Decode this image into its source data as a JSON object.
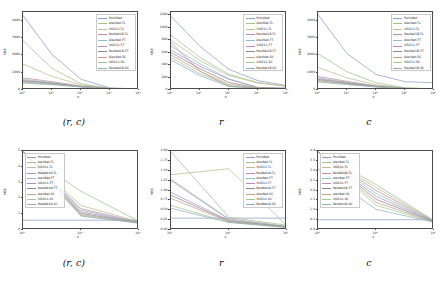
{
  "figure": {
    "title": "",
    "panel_captions": [
      "(r, c)",
      "r",
      "c",
      "(r, c)",
      "r",
      "c"
    ]
  },
  "legend_labels": [
    "PointNet",
    "AlexNet-TL",
    "VGG11-TL",
    "ResNet18-TL",
    "AlexNet-FT",
    "VGG11-FT",
    "ResNet18-FT",
    "AlexNet-SC",
    "VGG11-SC",
    "ResNet18-SC"
  ],
  "colors": {
    "PointNet": "#8c9ec4",
    "AlexNet-TL": "#9ec48c",
    "VGG11-TL": "#c4b98c",
    "ResNet18-TL": "#c48c9e",
    "AlexNet-FT": "#8cc4bd",
    "VGG11-FT": "#b08cc4",
    "ResNet18-FT": "#8a8a8a",
    "AlexNet-SC": "#c4a08c",
    "VGG11-SC": "#a7c48c",
    "ResNet18-SC": "#8cb0c4"
  },
  "panels": [
    {
      "id": "top-left",
      "caption": "(r, c)",
      "legend_position": "upper-right",
      "chart_data": {
        "type": "line",
        "title": "",
        "xlabel": "n",
        "ylabel": "MSE",
        "xscale": "log",
        "xlim": [
          1,
          10000
        ],
        "ylim": [
          0,
          4500
        ],
        "xticks": [
          "10⁰",
          "10¹",
          "10²",
          "10³",
          "10⁴"
        ],
        "xtick_values": [
          1,
          10,
          100,
          1000,
          10000
        ],
        "yticks": [
          "4000",
          "3000",
          "2000",
          "1000",
          "0"
        ],
        "ytick_values": [
          4000,
          3000,
          2000,
          1000,
          0
        ],
        "grid": false,
        "legend_position": "upper right",
        "x": [
          1,
          10,
          100,
          1000,
          10000
        ],
        "series": [
          {
            "name": "PointNet",
            "values": [
              4300,
              2050,
              620,
              120,
              60
            ]
          },
          {
            "name": "AlexNet-TL",
            "values": [
              2850,
              1250,
              360,
              95,
              55
            ]
          },
          {
            "name": "VGG11-TL",
            "values": [
              1500,
              780,
              300,
              90,
              50
            ]
          },
          {
            "name": "ResNet18-TL",
            "values": [
              700,
              480,
              230,
              85,
              50
            ]
          },
          {
            "name": "AlexNet-FT",
            "values": [
              620,
              430,
              210,
              80,
              48
            ]
          },
          {
            "name": "VGG11-FT",
            "values": [
              560,
              400,
              200,
              78,
              46
            ]
          },
          {
            "name": "ResNet18-FT",
            "values": [
              520,
              380,
              195,
              75,
              45
            ]
          },
          {
            "name": "AlexNet-SC",
            "values": [
              480,
              350,
              185,
              72,
              44
            ]
          },
          {
            "name": "VGG11-SC",
            "values": [
              440,
              330,
              180,
              70,
              42
            ]
          },
          {
            "name": "ResNet18-SC",
            "values": [
              400,
              310,
              175,
              68,
              40
            ]
          }
        ]
      }
    },
    {
      "id": "top-middle",
      "caption": "r",
      "legend_position": "upper-right",
      "chart_data": {
        "type": "line",
        "title": "",
        "xlabel": "n",
        "ylabel": "MSE",
        "xscale": "log",
        "xlim": [
          1,
          10000
        ],
        "ylim": [
          0,
          1250
        ],
        "xticks": [
          "10⁰",
          "10¹",
          "10²",
          "10³",
          "10⁴"
        ],
        "xtick_values": [
          1,
          10,
          100,
          1000,
          10000
        ],
        "yticks": [
          "1200",
          "1000",
          "800",
          "600",
          "400",
          "200",
          "0"
        ],
        "ytick_values": [
          1200,
          1000,
          800,
          600,
          400,
          200,
          0
        ],
        "grid": false,
        "legend_position": "upper right",
        "x": [
          1,
          10,
          100,
          1000,
          10000
        ],
        "series": [
          {
            "name": "PointNet",
            "values": [
              1180,
              700,
              330,
              150,
              70
            ]
          },
          {
            "name": "AlexNet-TL",
            "values": [
              880,
              520,
              250,
              120,
              60
            ]
          },
          {
            "name": "VGG11-TL",
            "values": [
              800,
              470,
              230,
              110,
              58
            ]
          },
          {
            "name": "ResNet18-TL",
            "values": [
              760,
              300,
              60,
              30,
              25
            ]
          },
          {
            "name": "AlexNet-FT",
            "values": [
              700,
              420,
              180,
              40,
              28
            ]
          },
          {
            "name": "VGG11-FT",
            "values": [
              640,
              380,
              170,
              38,
              26
            ]
          },
          {
            "name": "ResNet18-FT",
            "values": [
              600,
              340,
              120,
              32,
              24
            ]
          },
          {
            "name": "AlexNet-SC",
            "values": [
              560,
              300,
              90,
              30,
              22
            ]
          },
          {
            "name": "VGG11-SC",
            "values": [
              520,
              260,
              70,
              28,
              20
            ]
          },
          {
            "name": "ResNet18-SC",
            "values": [
              480,
              230,
              55,
              26,
              18
            ]
          }
        ]
      }
    },
    {
      "id": "top-right",
      "caption": "c",
      "legend_position": "upper-right",
      "chart_data": {
        "type": "line",
        "title": "",
        "xlabel": "n",
        "ylabel": "MSE",
        "xscale": "log",
        "xlim": [
          1,
          10000
        ],
        "ylim": [
          0,
          4500
        ],
        "xticks": [
          "10⁰",
          "10¹",
          "10²",
          "10³",
          "10⁴"
        ],
        "xtick_values": [
          1,
          10,
          100,
          1000,
          10000
        ],
        "yticks": [
          "4000",
          "3000",
          "2000",
          "1000",
          "0"
        ],
        "ytick_values": [
          4000,
          3000,
          2000,
          1000,
          0
        ],
        "grid": false,
        "legend_position": "upper right",
        "x": [
          1,
          10,
          100,
          1000,
          10000
        ],
        "series": [
          {
            "name": "PointNet",
            "values": [
              4350,
              2100,
              900,
              480,
              420
            ]
          },
          {
            "name": "AlexNet-TL",
            "values": [
              2100,
              1050,
              420,
              130,
              70
            ]
          },
          {
            "name": "VGG11-TL",
            "values": [
              1300,
              700,
              300,
              110,
              60
            ]
          },
          {
            "name": "ResNet18-TL",
            "values": [
              780,
              500,
              240,
              95,
              55
            ]
          },
          {
            "name": "AlexNet-FT",
            "values": [
              700,
              450,
              220,
              90,
              52
            ]
          },
          {
            "name": "VGG11-FT",
            "values": [
              650,
              420,
              210,
              85,
              50
            ]
          },
          {
            "name": "ResNet18-FT",
            "values": [
              600,
              390,
              200,
              82,
              48
            ]
          },
          {
            "name": "AlexNet-SC",
            "values": [
              550,
              360,
              190,
              78,
              46
            ]
          },
          {
            "name": "VGG11-SC",
            "values": [
              500,
              335,
              182,
              74,
              44
            ]
          },
          {
            "name": "ResNet18-SC",
            "values": [
              460,
              315,
              176,
              70,
              42
            ]
          }
        ]
      }
    },
    {
      "id": "bottom-left",
      "caption": "(r, c)",
      "legend_position": "upper-left",
      "chart_data": {
        "type": "line",
        "title": "",
        "xlabel": "λ",
        "ylabel": "MSE",
        "xscale": "log",
        "xlim": [
          1,
          100
        ],
        "ylim": [
          0,
          5
        ],
        "xticks": [
          "10⁰",
          "10¹",
          "10²"
        ],
        "xtick_values": [
          1,
          10,
          100
        ],
        "yticks": [
          "5",
          "4",
          "3",
          "2",
          "1",
          "0"
        ],
        "ytick_values": [
          5,
          4,
          3,
          2,
          1,
          0
        ],
        "grid": false,
        "legend_position": "upper left",
        "x": [
          1,
          10,
          100
        ],
        "series": [
          {
            "name": "PointNet",
            "values": [
              0.62,
              0.62,
              0.62
            ]
          },
          {
            "name": "AlexNet-TL",
            "values": [
              4.95,
              2.45,
              0.55
            ]
          },
          {
            "name": "VGG11-TL",
            "values": [
              4.95,
              1.55,
              0.52
            ]
          },
          {
            "name": "ResNet18-TL",
            "values": [
              4.95,
              1.35,
              0.5
            ]
          },
          {
            "name": "AlexNet-FT",
            "values": [
              4.95,
              1.25,
              0.48
            ]
          },
          {
            "name": "VGG11-FT",
            "values": [
              4.95,
              1.15,
              0.47
            ]
          },
          {
            "name": "ResNet18-FT",
            "values": [
              4.95,
              1.05,
              0.46
            ]
          },
          {
            "name": "AlexNet-SC",
            "values": [
              4.95,
              0.98,
              0.45
            ]
          },
          {
            "name": "VGG11-SC",
            "values": [
              4.95,
              0.92,
              0.44
            ]
          },
          {
            "name": "ResNet18-SC",
            "values": [
              4.95,
              0.88,
              0.43
            ]
          }
        ]
      }
    },
    {
      "id": "bottom-middle",
      "caption": "r",
      "legend_position": "upper-right",
      "chart_data": {
        "type": "line",
        "title": "",
        "xlabel": "λ",
        "ylabel": "MSE",
        "xscale": "log",
        "xlim": [
          1,
          100
        ],
        "ylim": [
          0,
          2
        ],
        "xticks": [
          "10⁰",
          "10¹",
          "10²"
        ],
        "xtick_values": [
          1,
          10,
          100
        ],
        "yticks": [
          "2.00",
          "1.75",
          "1.50",
          "1.25",
          "1.00",
          "0.75",
          "0.50",
          "0.25",
          "0.00"
        ],
        "ytick_values": [
          2.0,
          1.75,
          1.5,
          1.25,
          1.0,
          0.75,
          0.5,
          0.25,
          0.0
        ],
        "grid": false,
        "legend_position": "upper right",
        "x": [
          1,
          10,
          100
        ],
        "series": [
          {
            "name": "PointNet",
            "values": [
              0.3,
              0.3,
              0.3
            ]
          },
          {
            "name": "AlexNet-TL",
            "values": [
              1.98,
              0.32,
              0.12
            ]
          },
          {
            "name": "VGG11-TL",
            "values": [
              1.4,
              1.55,
              0.1
            ]
          },
          {
            "name": "ResNet18-TL",
            "values": [
              1.28,
              0.28,
              0.09
            ]
          },
          {
            "name": "AlexNet-FT",
            "values": [
              1.25,
              0.26,
              0.09
            ]
          },
          {
            "name": "VGG11-FT",
            "values": [
              0.95,
              0.24,
              0.08
            ]
          },
          {
            "name": "ResNet18-FT",
            "values": [
              0.88,
              0.22,
              0.08
            ]
          },
          {
            "name": "AlexNet-SC",
            "values": [
              0.8,
              0.21,
              0.07
            ]
          },
          {
            "name": "VGG11-SC",
            "values": [
              0.62,
              0.2,
              0.07
            ]
          },
          {
            "name": "ResNet18-SC",
            "values": [
              0.55,
              0.19,
              0.06
            ]
          }
        ]
      }
    },
    {
      "id": "bottom-right",
      "caption": "c",
      "legend_position": "upper-left",
      "chart_data": {
        "type": "line",
        "title": "",
        "xlabel": "λ",
        "ylabel": "MSE",
        "xscale": "log",
        "xlim": [
          1,
          100
        ],
        "ylim": [
          0,
          4
        ],
        "xticks": [
          "10⁰",
          "10¹",
          "10²"
        ],
        "xtick_values": [
          1,
          10,
          100
        ],
        "yticks": [
          "4.0",
          "3.5",
          "3.0",
          "2.5",
          "2.0",
          "1.5",
          "1.0",
          "0.5",
          "0.0"
        ],
        "ytick_values": [
          4.0,
          3.5,
          3.0,
          2.5,
          2.0,
          1.5,
          1.0,
          0.5,
          0.0
        ],
        "grid": false,
        "legend_position": "upper left",
        "x": [
          1,
          10,
          100
        ],
        "series": [
          {
            "name": "PointNet",
            "values": [
              0.52,
              0.52,
              0.52
            ]
          },
          {
            "name": "AlexNet-TL",
            "values": [
              3.95,
              2.3,
              0.48
            ]
          },
          {
            "name": "VGG11-TL",
            "values": [
              3.95,
              2.15,
              0.46
            ]
          },
          {
            "name": "ResNet18-TL",
            "values": [
              3.95,
              2.0,
              0.45
            ]
          },
          {
            "name": "AlexNet-FT",
            "values": [
              3.95,
              1.85,
              0.44
            ]
          },
          {
            "name": "VGG11-FT",
            "values": [
              3.95,
              1.7,
              0.43
            ]
          },
          {
            "name": "ResNet18-FT",
            "values": [
              3.95,
              1.55,
              0.42
            ]
          },
          {
            "name": "AlexNet-SC",
            "values": [
              3.95,
              1.4,
              0.41
            ]
          },
          {
            "name": "VGG11-SC",
            "values": [
              3.95,
              1.25,
              0.4
            ]
          },
          {
            "name": "ResNet18-SC",
            "values": [
              3.1,
              1.05,
              0.39
            ]
          }
        ]
      }
    }
  ]
}
